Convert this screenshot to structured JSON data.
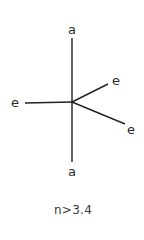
{
  "diagram": {
    "center": {
      "x": 72,
      "y": 102
    },
    "line_color": "#222222",
    "bonds": [
      {
        "id": "axial-top",
        "to": {
          "x": 72,
          "y": 38
        },
        "label": "a",
        "label_pos": {
          "x": 72,
          "y": 29
        }
      },
      {
        "id": "axial-bottom",
        "to": {
          "x": 72,
          "y": 162
        },
        "label": "a",
        "label_pos": {
          "x": 72,
          "y": 171
        }
      },
      {
        "id": "equatorial-left",
        "to": {
          "x": 25,
          "y": 103
        },
        "label": "e",
        "label_pos": {
          "x": 15,
          "y": 102
        }
      },
      {
        "id": "equatorial-upper-right",
        "to": {
          "x": 108,
          "y": 84
        },
        "label": "e",
        "label_pos": {
          "x": 116,
          "y": 80
        }
      },
      {
        "id": "equatorial-lower-right",
        "to": {
          "x": 125,
          "y": 124
        },
        "label": "e",
        "label_pos": {
          "x": 131,
          "y": 129
        }
      }
    ],
    "caption": "n>3.4",
    "caption_pos": {
      "x": 73,
      "y": 210
    }
  }
}
